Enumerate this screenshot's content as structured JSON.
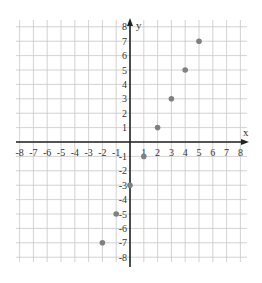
{
  "chart_data": {
    "type": "scatter",
    "title": "",
    "xlabel": "x",
    "ylabel": "y",
    "xlim": [
      -8,
      8
    ],
    "ylim": [
      -8,
      8
    ],
    "grid": true,
    "x_ticks": [
      "-8",
      "-7",
      "-6",
      "-5",
      "-4",
      "-3",
      "-2",
      "-1",
      "1",
      "2",
      "3",
      "4",
      "5",
      "6",
      "7",
      "8"
    ],
    "y_ticks": [
      "8",
      "7",
      "6",
      "5",
      "4",
      "3",
      "2",
      "1",
      "-1",
      "-2",
      "-3",
      "-4",
      "-5",
      "-6",
      "-7",
      "-8"
    ],
    "series": [
      {
        "name": "points",
        "color": "#808080",
        "points": [
          {
            "x": -2,
            "y": -7
          },
          {
            "x": -1,
            "y": -5
          },
          {
            "x": 0,
            "y": -3
          },
          {
            "x": 1,
            "y": -1
          },
          {
            "x": 2,
            "y": 1
          },
          {
            "x": 3,
            "y": 3
          },
          {
            "x": 4,
            "y": 5
          },
          {
            "x": 5,
            "y": 7
          }
        ]
      }
    ]
  }
}
